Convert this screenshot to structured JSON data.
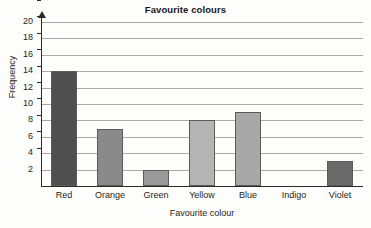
{
  "chart_data": {
    "type": "bar",
    "title": "Favourite colours",
    "xlabel": "Favourite colour",
    "ylabel": "Frequency",
    "categories": [
      "Red",
      "Orange",
      "Green",
      "Yellow",
      "Blue",
      "Indigo",
      "Violet"
    ],
    "values": [
      14,
      7,
      2,
      8,
      9,
      0,
      3
    ],
    "ylim": [
      0,
      20
    ],
    "y_ticks": [
      2,
      4,
      6,
      8,
      10,
      12,
      14,
      16,
      18,
      20
    ],
    "y_tick_labels": [
      "2",
      "4",
      "6",
      "8",
      "10",
      "12",
      "14",
      "16",
      "18",
      "20"
    ],
    "grid": "horizontal",
    "legend": "none",
    "bar_colors": [
      "#4f4f4f",
      "#8a8a8a",
      "#9a9a9a",
      "#b4b4b4",
      "#a8a8a8",
      "#ffffff",
      "#6a6a6a"
    ],
    "axis_color": "#2b2b2b",
    "gridline_color": "#a9a9a9",
    "bar_edge_color": "#5b5b5b"
  }
}
